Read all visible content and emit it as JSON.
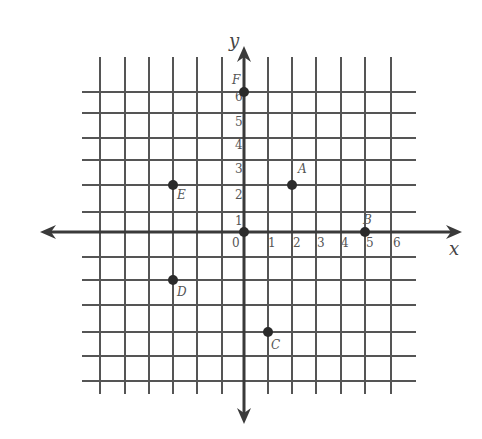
{
  "diagram": {
    "type": "coordinate-plane",
    "colors": {
      "grid": "#555555",
      "axis": "#3a3a3a",
      "point": "#2b2b2b",
      "label": "#555555",
      "background": "#ffffff"
    },
    "axes": {
      "x_label": "x",
      "y_label": "y",
      "x_tick_labels": [
        "0",
        "1",
        "2",
        "3",
        "4",
        "5",
        "6"
      ],
      "y_tick_labels": [
        "1",
        "2",
        "3",
        "4",
        "5",
        "6"
      ],
      "range": {
        "x": [
          -6,
          6
        ],
        "y": [
          -6,
          6
        ]
      }
    },
    "points": [
      {
        "label": "A",
        "x": 2,
        "y": 2
      },
      {
        "label": "B",
        "x": 5,
        "y": 0
      },
      {
        "label": "C",
        "x": 1,
        "y": -4
      },
      {
        "label": "D",
        "x": -3,
        "y": -2
      },
      {
        "label": "E",
        "x": -3,
        "y": 2
      },
      {
        "label": "F",
        "x": 0,
        "y": 6
      }
    ],
    "origin_marked": true
  }
}
